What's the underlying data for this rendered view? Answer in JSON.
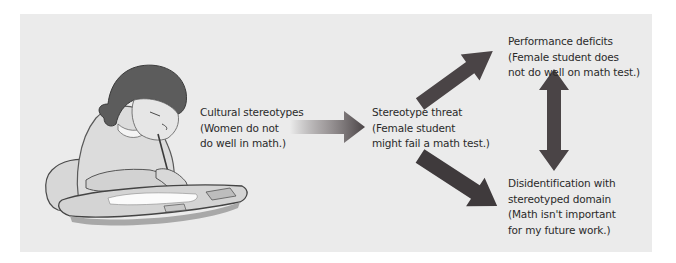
{
  "figure": {
    "illustration": "girl-writing-at-desk",
    "nodes": {
      "cultural": {
        "title": "Cultural stereotypes",
        "line2": "(Women do not",
        "line3": "do well in math.)"
      },
      "threat": {
        "title": "Stereotype threat",
        "line2": "(Female student",
        "line3": "might fail a math test.)"
      },
      "performance": {
        "title": "Performance deficits",
        "line2": "(Female student does",
        "line3": "not do well on math test.)"
      },
      "disidentification": {
        "title": "Disidentification with",
        "line2": "stereotyped domain",
        "line3": "(Math isn't important",
        "line4": "for my future work.)"
      }
    },
    "edges": [
      {
        "from": "cultural",
        "to": "threat",
        "style": "gradient-arrow"
      },
      {
        "from": "threat",
        "to": "performance",
        "style": "solid-arrow"
      },
      {
        "from": "threat",
        "to": "disidentification",
        "style": "solid-arrow"
      },
      {
        "from": "performance",
        "to": "disidentification",
        "style": "double-arrow"
      }
    ],
    "colors": {
      "background": "#ebebeb",
      "arrow": "#4a4446",
      "text": "#2a2a2a"
    }
  }
}
